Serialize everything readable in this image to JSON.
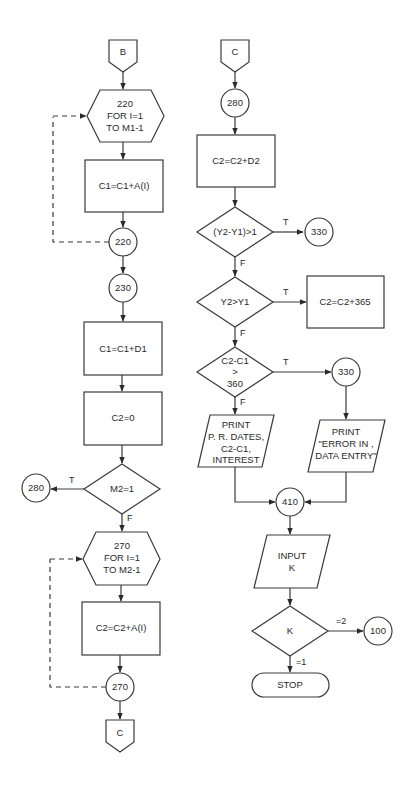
{
  "diagram": {
    "type": "flowchart",
    "left_column": {
      "entry_connector": "B",
      "loop1": {
        "label_line1": "220",
        "label_line2": "FOR I=1",
        "label_line3": "TO M1-1"
      },
      "box1": "C1=C1+A(I)",
      "loop1_end": "220",
      "node230": "230",
      "box2": "C1=C1+D1",
      "box3": "C2=0",
      "decision_m2": "M2=1",
      "decision_m2_true_label": "T",
      "decision_m2_false_label": "F",
      "goto_280": "280",
      "loop2": {
        "label_line1": "270",
        "label_line2": "FOR I=1",
        "label_line3": "TO M2-1"
      },
      "box4": "C2=C2+A(I)",
      "loop2_end": "270",
      "exit_connector": "C"
    },
    "right_column": {
      "entry_connector": "C",
      "node280": "280",
      "box1": "C2=C2+D2",
      "decision1": "(Y2-Y1)>1",
      "decision1_true_label": "T",
      "decision1_false_label": "F",
      "goto_330_a": "330",
      "decision2": "Y2>Y1",
      "decision2_true_label": "T",
      "decision2_false_label": "F",
      "box_365": "C2=C2+365",
      "decision3": {
        "line1": "C2-C1",
        "line2": ">",
        "line3": "360"
      },
      "decision3_true_label": "T",
      "decision3_false_label": "F",
      "node330": "330",
      "print_left": {
        "line1": "PRINT",
        "line2": "P. R. DATES,",
        "line3": "C2-C1,",
        "line4": "INTEREST"
      },
      "print_right": {
        "line1": "PRINT",
        "line2": "\"ERROR IN ,",
        "line3": "DATA ENTRY\""
      },
      "node410": "410",
      "input": {
        "line1": "INPUT",
        "line2": "K"
      },
      "decision_k": "K",
      "decision_k_right_label": "=2",
      "decision_k_down_label": "=1",
      "goto_100": "100",
      "terminal": "STOP"
    }
  }
}
